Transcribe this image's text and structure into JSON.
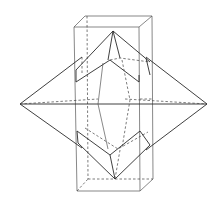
{
  "diagram": {
    "colors": {
      "line": "#2a2a2a",
      "background": "#ffffff"
    },
    "prism": {
      "top_front_left": [
        74,
        27
      ],
      "top_front_right": [
        139,
        27
      ],
      "top_back_left": [
        85,
        16
      ],
      "top_back_right": [
        152,
        16
      ],
      "bottom_front_left": [
        77,
        191
      ],
      "bottom_front_right": [
        140,
        191
      ],
      "bottom_back_left": [
        88,
        179
      ],
      "bottom_back_right": [
        153,
        179
      ]
    },
    "bipyramid": {
      "left_apex": [
        20,
        104
      ],
      "right_apex": [
        207,
        104
      ],
      "top_apex": [
        113,
        31
      ],
      "bottom_apex": [
        115,
        179
      ]
    }
  }
}
